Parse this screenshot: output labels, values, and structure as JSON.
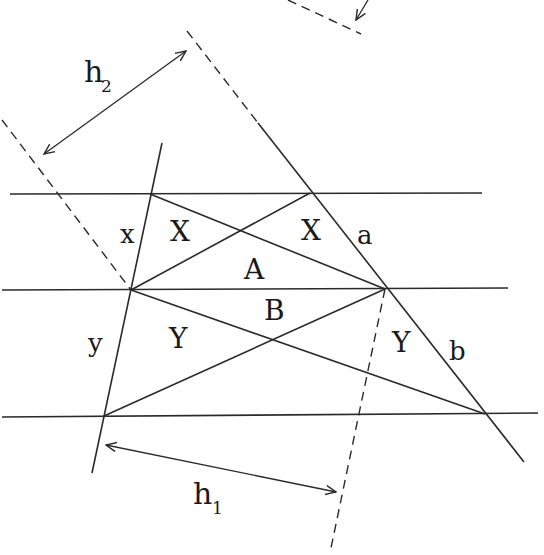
{
  "diagram": {
    "labels": {
      "h2": "h",
      "h2_sub": "2",
      "h1": "h",
      "h1_sub": "1",
      "x_small": "x",
      "y_small": "y",
      "X_left": "X",
      "X_right": "X",
      "A": "A",
      "B": "B",
      "Y_left": "Y",
      "Y_right": "Y",
      "a": "a",
      "b": "b"
    },
    "colors": {
      "stroke": "#2a2a2a",
      "background": "#ffffff"
    }
  }
}
